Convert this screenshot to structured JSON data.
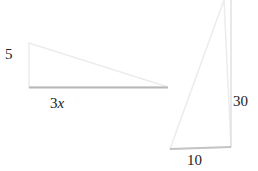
{
  "diagram": {
    "triangles": [
      {
        "name": "small-triangle",
        "vertical_side_label": "5",
        "horizontal_side_label": "3x",
        "label_parts": {
          "coef": "3",
          "var": "x"
        }
      },
      {
        "name": "large-triangle",
        "vertical_side_label": "30",
        "horizontal_side_label": "10"
      }
    ],
    "colors": {
      "edge": "#e6e6e6",
      "shadow": "#b8b8b8",
      "text": "#222222"
    }
  }
}
